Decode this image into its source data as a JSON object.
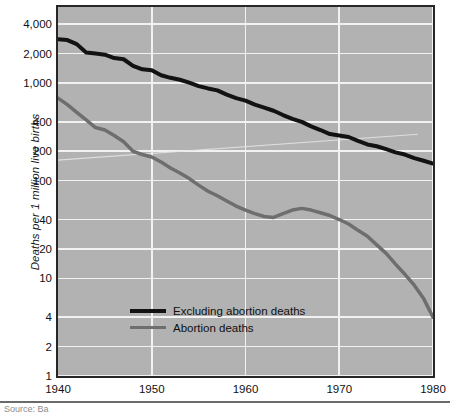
{
  "figure": {
    "background_color": "#ffffff",
    "plot_background_color": "#b2b2b2",
    "gridline_color": "#f2f2f2",
    "frame_color": "#272727"
  },
  "source": {
    "rule_visible": true,
    "text": "Source: Ba"
  },
  "chart_data": {
    "type": "line",
    "title": "",
    "subtitle": "",
    "xlabel": "",
    "ylabel": "Deaths per 1 million live births",
    "yscale": "log",
    "xscale": "linear",
    "xlim": [
      1940,
      1980
    ],
    "ylim": [
      1,
      6000
    ],
    "grid": true,
    "legend_position": "inside-lower-left",
    "xticks": [
      1940,
      1950,
      1960,
      1970,
      1980
    ],
    "xticklabels": [
      "1940",
      "1950",
      "1960",
      "1970",
      "1980"
    ],
    "yticks": [
      1,
      2,
      4,
      10,
      20,
      40,
      100,
      200,
      400,
      1000,
      2000,
      4000
    ],
    "yticklabels": [
      "1",
      "2",
      "4",
      "10",
      "20",
      "40",
      "100",
      "200",
      "400",
      "1,000",
      "2,000",
      "4,000"
    ],
    "series": [
      {
        "name": "Excluding abortion deaths",
        "color": "#121212",
        "linewidth": 4,
        "x": [
          1940,
          1941,
          1942,
          1943,
          1944,
          1945,
          1946,
          1947,
          1948,
          1949,
          1950,
          1951,
          1952,
          1953,
          1954,
          1955,
          1956,
          1957,
          1958,
          1959,
          1960,
          1961,
          1962,
          1963,
          1964,
          1965,
          1966,
          1967,
          1968,
          1969,
          1970,
          1971,
          1972,
          1973,
          1974,
          1975,
          1976,
          1977,
          1978,
          1979,
          1980
        ],
        "values": [
          2800,
          2750,
          2500,
          2050,
          2000,
          1950,
          1800,
          1750,
          1500,
          1380,
          1350,
          1200,
          1130,
          1080,
          1010,
          930,
          880,
          840,
          760,
          700,
          660,
          600,
          560,
          520,
          470,
          430,
          400,
          360,
          330,
          300,
          290,
          280,
          255,
          235,
          225,
          210,
          195,
          185,
          170,
          160,
          150
        ]
      },
      {
        "name": "Abortion deaths",
        "color": "#6e6e6e",
        "linewidth": 3.5,
        "x": [
          1940,
          1941,
          1942,
          1943,
          1944,
          1945,
          1946,
          1947,
          1948,
          1949,
          1950,
          1951,
          1952,
          1953,
          1954,
          1955,
          1956,
          1957,
          1958,
          1959,
          1960,
          1961,
          1962,
          1963,
          1964,
          1965,
          1966,
          1967,
          1968,
          1969,
          1970,
          1971,
          1972,
          1973,
          1974,
          1975,
          1976,
          1977,
          1978,
          1979,
          1980
        ],
        "values": [
          700,
          600,
          500,
          420,
          350,
          330,
          290,
          250,
          200,
          185,
          175,
          155,
          135,
          120,
          105,
          90,
          78,
          70,
          62,
          55,
          50,
          46,
          43,
          42,
          46,
          50,
          52,
          50,
          47,
          44,
          40,
          36,
          31,
          27,
          22,
          18,
          14,
          11,
          8.5,
          6.2,
          4.0
        ]
      }
    ]
  }
}
